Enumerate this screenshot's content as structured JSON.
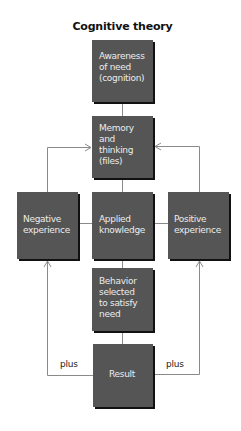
{
  "diagram": {
    "title": "Cognitive theory",
    "colors": {
      "box_fill": "#555555",
      "box_shadow": "#111111",
      "box_text": "#ececec",
      "connector": "#8a8a8a",
      "background": "#ffffff"
    },
    "nodes": {
      "awareness": "Awareness\nof need\n(cognition)",
      "memory": "Memory\nand\nthinking\n(files)",
      "negative": "Negative\nexperience",
      "applied": "Applied\nknowledge",
      "positive": "Positive\nexperience",
      "behavior": "Behavior\nselected\nto satisfy\nneed",
      "result": "Result"
    },
    "edge_labels": {
      "left_plus": "plus",
      "right_plus": "plus"
    },
    "edges": [
      {
        "from": "awareness",
        "to": "memory"
      },
      {
        "from": "memory",
        "to": "applied"
      },
      {
        "from": "applied",
        "to": "negative"
      },
      {
        "from": "applied",
        "to": "positive"
      },
      {
        "from": "applied",
        "to": "behavior"
      },
      {
        "from": "behavior",
        "to": "result"
      },
      {
        "from": "negative",
        "to": "memory",
        "arrow": true
      },
      {
        "from": "positive",
        "to": "memory",
        "arrow": true
      },
      {
        "from": "result",
        "to": "negative",
        "arrow": true,
        "label": "plus"
      },
      {
        "from": "result",
        "to": "positive",
        "arrow": true,
        "label": "plus"
      }
    ]
  }
}
